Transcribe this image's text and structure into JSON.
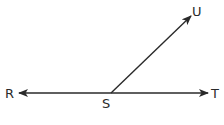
{
  "diagram": {
    "type": "geometry-angle",
    "stroke_color": "#2a2a2a",
    "points": {
      "R": {
        "label": "R",
        "x": 19,
        "y": 93
      },
      "S": {
        "label": "S",
        "x": 111,
        "y": 93
      },
      "T": {
        "label": "T",
        "x": 208,
        "y": 93
      },
      "U": {
        "label": "U",
        "x": 191,
        "y": 16
      }
    },
    "labels": {
      "R": "R",
      "S": "S",
      "T": "T",
      "U": "U"
    },
    "elements": [
      {
        "kind": "line",
        "name": "RT",
        "from": "R",
        "to": "T",
        "arrows": "both"
      },
      {
        "kind": "ray",
        "name": "SU",
        "from": "S",
        "to": "U",
        "arrows": "end"
      }
    ]
  }
}
